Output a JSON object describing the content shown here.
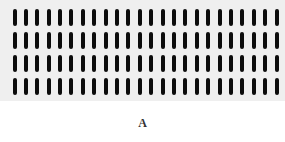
{
  "figure": {
    "label": "A",
    "pattern": {
      "rows": 4,
      "columns": 24,
      "bar_color": "#0c0c0c",
      "background_color": "#efefef"
    }
  }
}
